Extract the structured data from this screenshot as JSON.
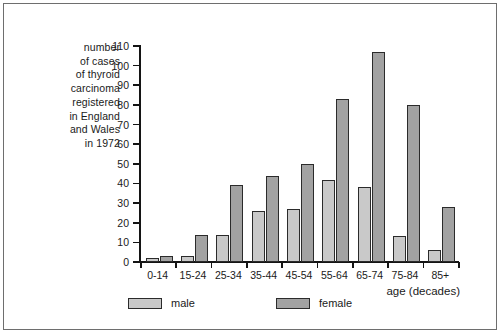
{
  "chart_data": {
    "type": "bar",
    "title": "",
    "ylabel": "number of cases of thyroid carcinoma registered in England and Wales in 1972",
    "ylabel_lines": "number\nof cases\nof thyroid\ncarcinoma\nregistered\nin England\nand Wales\nin 1972",
    "xlabel": "age (decades)",
    "categories": [
      "0-14",
      "15-24",
      "25-34",
      "35-44",
      "45-54",
      "55-64",
      "65-74",
      "75-84",
      "85+"
    ],
    "series": [
      {
        "name": "male",
        "color": "#c9c9c9",
        "values": [
          2,
          3,
          14,
          26,
          27,
          42,
          38,
          13,
          6
        ]
      },
      {
        "name": "female",
        "color": "#a2a2a2",
        "values": [
          3,
          14,
          39,
          44,
          50,
          83,
          107,
          80,
          28
        ]
      }
    ],
    "ylim": [
      0,
      110
    ],
    "y_ticks": [
      0,
      10,
      20,
      30,
      40,
      50,
      60,
      70,
      80,
      90,
      100,
      110
    ],
    "y_tick_labels": [
      "0",
      "10",
      "20",
      "30",
      "40",
      "50",
      "60",
      "70",
      "80",
      "90",
      "100",
      "110"
    ],
    "grid": false,
    "legend_position": "bottom-left",
    "legend": [
      "male",
      "female"
    ]
  }
}
